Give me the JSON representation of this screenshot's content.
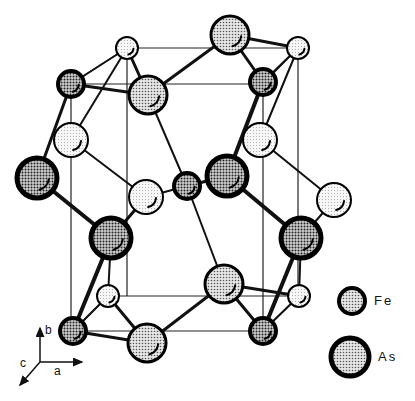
{
  "legend": [
    {
      "label": "Fe",
      "atom": "Fe"
    },
    {
      "label": "As",
      "atom": "As"
    }
  ],
  "axes": {
    "a": "a",
    "b": "b",
    "c": "c"
  },
  "atom_styles": {
    "Fe_front": {
      "r": 13,
      "fill": "#9a9a9a",
      "stroke": "#000",
      "sw": 4
    },
    "Fe_back": {
      "r": 11,
      "fill": "#f4f4f4",
      "stroke": "#000",
      "sw": 2
    },
    "As_front": {
      "r": 20,
      "fill": "#8f8f8f",
      "stroke": "#000",
      "sw": 5
    },
    "As_mid": {
      "r": 19,
      "fill": "#c6c6c6",
      "stroke": "#000",
      "sw": 3
    },
    "As_back": {
      "r": 17,
      "fill": "#efefef",
      "stroke": "#000",
      "sw": 2
    }
  },
  "atoms": [
    {
      "id": "t1",
      "x": 127,
      "y": 48,
      "style": "Fe_back"
    },
    {
      "id": "t2",
      "x": 230,
      "y": 35,
      "style": "As_mid"
    },
    {
      "id": "t3",
      "x": 298,
      "y": 48,
      "style": "Fe_back"
    },
    {
      "id": "r1",
      "x": 71,
      "y": 84,
      "style": "Fe_front"
    },
    {
      "id": "r2",
      "x": 148,
      "y": 95,
      "style": "As_mid"
    },
    {
      "id": "r3",
      "x": 263,
      "y": 82,
      "style": "Fe_front"
    },
    {
      "id": "s1",
      "x": 71,
      "y": 140,
      "style": "As_back"
    },
    {
      "id": "s2",
      "x": 260,
      "y": 140,
      "style": "As_back"
    },
    {
      "id": "m1",
      "x": 37,
      "y": 178,
      "style": "As_front"
    },
    {
      "id": "m2",
      "x": 146,
      "y": 197,
      "style": "As_back"
    },
    {
      "id": "m3",
      "x": 187,
      "y": 186,
      "style": "Fe_front"
    },
    {
      "id": "m4",
      "x": 227,
      "y": 176,
      "style": "As_front"
    },
    {
      "id": "m5",
      "x": 334,
      "y": 200,
      "style": "As_back"
    },
    {
      "id": "l1",
      "x": 111,
      "y": 238,
      "style": "As_front"
    },
    {
      "id": "l2",
      "x": 301,
      "y": 238,
      "style": "As_front"
    },
    {
      "id": "b1",
      "x": 108,
      "y": 296,
      "style": "Fe_back"
    },
    {
      "id": "b2",
      "x": 224,
      "y": 284,
      "style": "As_mid"
    },
    {
      "id": "b3",
      "x": 299,
      "y": 296,
      "style": "Fe_back"
    },
    {
      "id": "f1",
      "x": 73,
      "y": 331,
      "style": "Fe_front"
    },
    {
      "id": "f2",
      "x": 147,
      "y": 343,
      "style": "As_mid"
    },
    {
      "id": "f3",
      "x": 263,
      "y": 331,
      "style": "Fe_front"
    }
  ],
  "bonds": [
    [
      "t1",
      "r1",
      2
    ],
    [
      "t1",
      "r2",
      3
    ],
    [
      "t2",
      "r2",
      3
    ],
    [
      "t2",
      "r3",
      3
    ],
    [
      "t2",
      "t3",
      3
    ],
    [
      "t3",
      "r3",
      2
    ],
    [
      "r1",
      "m1",
      3
    ],
    [
      "r1",
      "r2",
      3
    ],
    [
      "t1",
      "s1",
      2
    ],
    [
      "r3",
      "m4",
      4
    ],
    [
      "t3",
      "s2",
      2
    ],
    [
      "r2",
      "m3",
      2
    ],
    [
      "s1",
      "m2",
      2
    ],
    [
      "s2",
      "m5",
      2
    ],
    [
      "m2",
      "m3",
      2
    ],
    [
      "m3",
      "m4",
      3
    ],
    [
      "m1",
      "l1",
      4
    ],
    [
      "m4",
      "l2",
      4
    ],
    [
      "m3",
      "b2",
      2
    ],
    [
      "m2",
      "l1",
      3
    ],
    [
      "m5",
      "l2",
      2
    ],
    [
      "l1",
      "f1",
      4
    ],
    [
      "l1",
      "b1",
      2
    ],
    [
      "l2",
      "f3",
      4
    ],
    [
      "l2",
      "b3",
      2
    ],
    [
      "b1",
      "f2",
      3
    ],
    [
      "b2",
      "f2",
      3
    ],
    [
      "b2",
      "f3",
      3
    ],
    [
      "b2",
      "b3",
      3
    ],
    [
      "f1",
      "f2",
      3
    ],
    [
      "f1",
      "b1",
      2
    ],
    [
      "f3",
      "b3",
      2
    ]
  ],
  "cell_lines": [
    [
      127,
      48,
      298,
      48
    ],
    [
      71,
      84,
      263,
      84
    ],
    [
      127,
      48,
      71,
      84
    ],
    [
      298,
      48,
      263,
      84
    ],
    [
      108,
      296,
      299,
      296
    ],
    [
      73,
      331,
      263,
      331
    ],
    [
      108,
      296,
      73,
      331
    ],
    [
      299,
      296,
      263,
      331
    ],
    [
      127,
      48,
      127,
      296
    ],
    [
      298,
      48,
      298,
      296
    ],
    [
      71,
      84,
      71,
      331
    ],
    [
      263,
      84,
      263,
      331
    ]
  ],
  "axis_arrows": {
    "origin": [
      40,
      362
    ],
    "b_end": [
      40,
      328
    ],
    "a_end": [
      82,
      362
    ],
    "c_end": [
      20,
      385
    ]
  }
}
